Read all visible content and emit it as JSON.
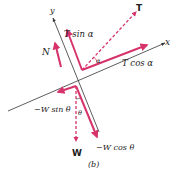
{
  "diagram": {
    "caption": "(b)",
    "colors": {
      "force": "#d6336c",
      "axis": "#333333",
      "text": "#222222",
      "background": "#ffffff"
    },
    "axes": {
      "x_label": "x",
      "y_label": "y"
    },
    "labels": {
      "tension": "T",
      "normal": "N",
      "weight": "W",
      "t_sin": "T sin α",
      "t_cos": "T cos α",
      "w_sin": "−W sin θ",
      "w_cos": "−W cos θ",
      "alpha": "α",
      "theta": "θ"
    },
    "vectors": [
      {
        "name": "tension",
        "style": "dashed",
        "from": [
          82,
          70
        ],
        "to": [
          137,
          11
        ]
      },
      {
        "name": "t-cos-alpha",
        "style": "solid",
        "from": [
          82,
          70
        ],
        "to": [
          148,
          45
        ]
      },
      {
        "name": "t-sin-alpha",
        "style": "solid",
        "from": [
          82,
          70
        ],
        "to": [
          67,
          29
        ]
      },
      {
        "name": "normal",
        "style": "solid",
        "from": [
          61,
          67
        ],
        "to": [
          55,
          42
        ]
      },
      {
        "name": "weight",
        "style": "dashed",
        "from": [
          76,
          86
        ],
        "to": [
          76,
          142
        ]
      },
      {
        "name": "w-sin-theta",
        "style": "solid",
        "from": [
          76,
          86
        ],
        "to": [
          57,
          92
        ]
      },
      {
        "name": "w-cos-theta",
        "style": "solid",
        "from": [
          76,
          86
        ],
        "to": [
          98,
          138
        ]
      }
    ]
  }
}
